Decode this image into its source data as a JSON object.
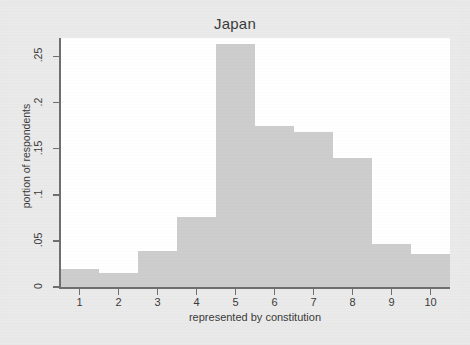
{
  "chart_data": {
    "type": "bar",
    "title": "Japan",
    "xlabel": "represented by constitution",
    "ylabel": "portion of respondents",
    "categories": [
      "1",
      "2",
      "3",
      "4",
      "5",
      "6",
      "7",
      "8",
      "9",
      "10"
    ],
    "values": [
      0.02,
      0.015,
      0.039,
      0.076,
      0.263,
      0.175,
      0.168,
      0.14,
      0.047,
      0.036
    ],
    "xtick_labels": [
      "1",
      "2",
      "3",
      "4",
      "5",
      "6",
      "7",
      "8",
      "9",
      "10"
    ],
    "ytick_labels": [
      "0",
      ".05",
      ".1",
      ".15",
      ".2",
      ".25"
    ],
    "ytick_values": [
      0,
      0.05,
      0.1,
      0.15,
      0.2,
      0.25
    ],
    "ylim": [
      0,
      0.27
    ],
    "xlim": [
      0.5,
      10.5
    ],
    "grid": false,
    "legend": null,
    "bar_color": "#cdcdcd",
    "axis_color": "#6f6f6f",
    "plot_background": "#ffffff",
    "figure_background": "#e9e9e9"
  }
}
